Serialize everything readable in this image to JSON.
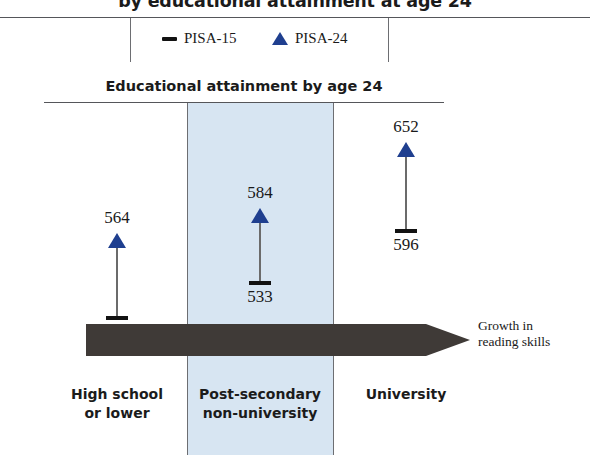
{
  "title": "by educational attainment at age 24",
  "legend": {
    "items": [
      {
        "label": "PISA-15",
        "marker": "dash-marker-icon",
        "color": "#121212"
      },
      {
        "label": "PISA-24",
        "marker": "triangle-marker-icon",
        "color": "#1f3f8f"
      }
    ]
  },
  "subtitle": "Educational attainment by age 24",
  "arrow": {
    "label_line1": "Growth in",
    "label_line2": "reading skills",
    "color": "#3f3a37"
  },
  "highlight_band_color": "#d7e5f2",
  "chart_data": {
    "type": "scatter",
    "title": "by educational attainment at age 24",
    "subtitle": "Educational attainment by age 24",
    "xlabel": "Educational attainment by age 24",
    "ylabel": "",
    "categories": [
      "High school or lower",
      "Post-secondary non-university",
      "University"
    ],
    "category_lines": [
      [
        "High school",
        "or lower"
      ],
      [
        "Post-secondary",
        "non-university"
      ],
      [
        "University"
      ]
    ],
    "series": [
      {
        "name": "PISA-15",
        "marker": "dash",
        "color": "#121212",
        "values": [
          499,
          533,
          596
        ]
      },
      {
        "name": "PISA-24",
        "marker": "triangle",
        "color": "#1f3f8f",
        "values": [
          564,
          584,
          652
        ]
      }
    ],
    "annotations": [
      "Growth in reading skills"
    ],
    "grid": false,
    "legend_position": "top",
    "highlighted_category": "Post-secondary non-university"
  },
  "groups": [
    {
      "top": "564",
      "bottom": "499"
    },
    {
      "top": "584",
      "bottom": "533"
    },
    {
      "top": "652",
      "bottom": "596"
    }
  ]
}
